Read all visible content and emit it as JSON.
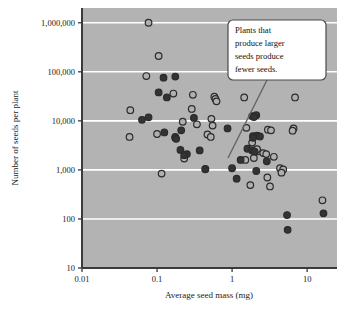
{
  "figure": {
    "name": "seed-mass-vs-seed-number-scatter",
    "background_color": "#ffffff",
    "plot_background_color": "#b3b3b3",
    "gridline_color": "#ffffff",
    "axis_color": "#3a3a3a",
    "marker_fill_dark": "#333333",
    "marker_fill_open": "#b0b0b0",
    "marker_stroke": "#2b2b2b"
  },
  "annotation": {
    "id": "callout-note",
    "lines": [
      "Plants that",
      "produce larger",
      "seeds produce",
      "fewer seeds."
    ],
    "full_text": "Plants that produce larger seeds produce fewer seeds.",
    "box_color": "#ffffff",
    "border_color": "#4a4a4a",
    "leader_line": true
  },
  "chart_data": {
    "type": "scatter",
    "title": "",
    "xlabel": "Average seed mass (mg)",
    "ylabel": "Number of seeds per plant",
    "xscale": "log",
    "yscale": "log",
    "xlim": [
      0.01,
      25
    ],
    "ylim": [
      10,
      2000000
    ],
    "xticks": [
      0.01,
      0.1,
      1,
      10
    ],
    "xtick_labels": [
      "0.01",
      "0.1",
      "1",
      "10"
    ],
    "yticks": [
      10,
      100,
      1000,
      10000,
      100000,
      1000000
    ],
    "ytick_labels": [
      "10",
      "100",
      "1,000",
      "10,000",
      "100,000",
      "1,000,000"
    ],
    "grid": true,
    "grid_axis": "y",
    "legend": "none",
    "series": [
      {
        "name": "open-markers",
        "marker": "open-circle",
        "points": [
          [
            0.077,
            1000000
          ],
          [
            0.105,
            210000
          ],
          [
            0.072,
            82000
          ],
          [
            0.165,
            36000
          ],
          [
            0.3,
            34000
          ],
          [
            0.58,
            31000
          ],
          [
            0.6,
            28000
          ],
          [
            0.62,
            25000
          ],
          [
            1.45,
            30000
          ],
          [
            6.9,
            30000
          ],
          [
            0.044,
            16500
          ],
          [
            0.29,
            17500
          ],
          [
            0.53,
            11000
          ],
          [
            0.34,
            8500
          ],
          [
            0.55,
            8000
          ],
          [
            0.22,
            9600
          ],
          [
            1.55,
            7200
          ],
          [
            6.6,
            7000
          ],
          [
            3.0,
            6600
          ],
          [
            3.3,
            6400
          ],
          [
            0.043,
            4700
          ],
          [
            0.1,
            5400
          ],
          [
            0.175,
            4500
          ],
          [
            0.47,
            5300
          ],
          [
            0.52,
            4700
          ],
          [
            1.85,
            3600
          ],
          [
            2.2,
            2400
          ],
          [
            2.6,
            2200
          ],
          [
            2.85,
            2100
          ],
          [
            3.6,
            1850
          ],
          [
            0.23,
            1700
          ],
          [
            1.5,
            1600
          ],
          [
            1.95,
            1750
          ],
          [
            2.15,
            2650
          ],
          [
            0.115,
            840
          ],
          [
            0.44,
            1030
          ],
          [
            4.35,
            1080
          ],
          [
            4.8,
            1020
          ],
          [
            4.55,
            880
          ],
          [
            2.95,
            700
          ],
          [
            1.75,
            490
          ],
          [
            3.2,
            460
          ],
          [
            16.0,
            240
          ],
          [
            6.4,
            6300
          ]
        ]
      },
      {
        "name": "filled-markers",
        "marker": "filled-circle",
        "points": [
          [
            0.122,
            76000
          ],
          [
            0.175,
            80000
          ],
          [
            0.105,
            38000
          ],
          [
            0.135,
            30000
          ],
          [
            0.063,
            10500
          ],
          [
            0.077,
            11800
          ],
          [
            0.31,
            11500
          ],
          [
            1.85,
            12500
          ],
          [
            2.1,
            13000
          ],
          [
            1.95,
            12000
          ],
          [
            0.125,
            5800
          ],
          [
            0.21,
            6400
          ],
          [
            0.87,
            7000
          ],
          [
            0.175,
            4700
          ],
          [
            0.18,
            4300
          ],
          [
            1.9,
            4900
          ],
          [
            2.15,
            5000
          ],
          [
            2.35,
            4800
          ],
          [
            1.9,
            4500
          ],
          [
            0.205,
            2550
          ],
          [
            0.25,
            2100
          ],
          [
            0.23,
            2000
          ],
          [
            0.37,
            2500
          ],
          [
            1.6,
            2700
          ],
          [
            1.85,
            2500
          ],
          [
            2.0,
            2350
          ],
          [
            1.3,
            1600
          ],
          [
            2.9,
            1500
          ],
          [
            0.44,
            1050
          ],
          [
            1.0,
            1080
          ],
          [
            2.1,
            950
          ],
          [
            1.15,
            660
          ],
          [
            5.4,
            120
          ],
          [
            5.5,
            60
          ],
          [
            16.5,
            130
          ]
        ]
      }
    ]
  }
}
